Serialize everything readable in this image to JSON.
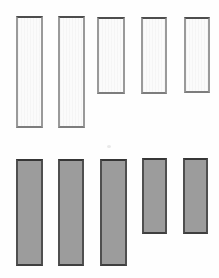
{
  "canvas": {
    "width_px": 219,
    "height_px": 278,
    "background": "#fefefe"
  },
  "figure": {
    "rows": [
      {
        "name": "top-row",
        "fill": "#fbfbfb",
        "textured": true,
        "border_top": "#4d4d4d",
        "border_side": "#9a9a9a",
        "border_bottom": "#7d7d7d",
        "bars": [
          {
            "x": 16,
            "y": 16,
            "w": 27,
            "h": 112
          },
          {
            "x": 58,
            "y": 16,
            "w": 27,
            "h": 112
          },
          {
            "x": 97,
            "y": 17,
            "w": 28,
            "h": 77
          },
          {
            "x": 141,
            "y": 17,
            "w": 26,
            "h": 77
          },
          {
            "x": 184,
            "y": 17,
            "w": 26,
            "h": 76
          }
        ]
      },
      {
        "name": "bottom-row",
        "fill": "#9c9c9c",
        "textured": false,
        "border_top": "#363636",
        "border_side": "#4f4f4f",
        "border_bottom": "#3f3f3f",
        "bars": [
          {
            "x": 16,
            "y": 159,
            "w": 27,
            "h": 107
          },
          {
            "x": 58,
            "y": 159,
            "w": 26,
            "h": 107
          },
          {
            "x": 100,
            "y": 159,
            "w": 27,
            "h": 107
          },
          {
            "x": 142,
            "y": 158,
            "w": 25,
            "h": 76
          },
          {
            "x": 183,
            "y": 158,
            "w": 25,
            "h": 76
          }
        ]
      }
    ],
    "artifacts": [
      {
        "name": "scan-speck",
        "x": 107,
        "y": 145,
        "w": 4,
        "h": 3,
        "color": "#e9e9e9"
      }
    ]
  }
}
